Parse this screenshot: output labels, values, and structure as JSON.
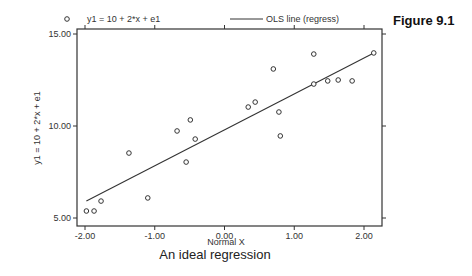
{
  "figure_label": "Figure 9.1",
  "caption": "An ideal regression",
  "legend": {
    "markers_label": "y1 = 10 + 2*x + e1",
    "line_label": "OLS line (regress)"
  },
  "colors": {
    "axis": "#333333",
    "points": "#333333",
    "line": "#333333",
    "background": "#ffffff"
  },
  "chart_data": {
    "type": "scatter",
    "title": "An ideal regression",
    "xlabel": "Normal X",
    "ylabel": "y1 = 10 + 2*x + e1",
    "xlim": [
      -2.1,
      2.3
    ],
    "ylim": [
      4.8,
      15.2
    ],
    "x_ticks": [
      -2.0,
      -1.0,
      0.0,
      1.0,
      2.0
    ],
    "x_tick_labels": [
      "-2.00",
      "-1.00",
      "0.00",
      "1.00",
      "2.00"
    ],
    "y_ticks": [
      5.0,
      10.0,
      15.0
    ],
    "y_tick_labels": [
      "5.00",
      "10.00",
      "15.00"
    ],
    "grid": false,
    "legend_position": "top",
    "series": [
      {
        "name": "y1 = 10 + 2*x + e1",
        "kind": "scatter",
        "marker": "hollow-circle",
        "points": [
          {
            "x": -1.98,
            "y": 5.38
          },
          {
            "x": -1.87,
            "y": 5.38
          },
          {
            "x": -1.77,
            "y": 5.92
          },
          {
            "x": -1.37,
            "y": 8.53
          },
          {
            "x": -1.1,
            "y": 6.09
          },
          {
            "x": -0.68,
            "y": 9.73
          },
          {
            "x": -0.55,
            "y": 8.04
          },
          {
            "x": -0.49,
            "y": 10.33
          },
          {
            "x": -0.42,
            "y": 9.29
          },
          {
            "x": 0.34,
            "y": 11.03
          },
          {
            "x": 0.44,
            "y": 11.3
          },
          {
            "x": 0.7,
            "y": 13.1
          },
          {
            "x": 0.78,
            "y": 10.76
          },
          {
            "x": 0.8,
            "y": 9.46
          },
          {
            "x": 1.28,
            "y": 13.91
          },
          {
            "x": 1.28,
            "y": 12.28
          },
          {
            "x": 1.48,
            "y": 12.45
          },
          {
            "x": 1.63,
            "y": 12.5
          },
          {
            "x": 1.83,
            "y": 12.45
          },
          {
            "x": 2.14,
            "y": 13.97
          }
        ]
      },
      {
        "name": "OLS line (regress)",
        "kind": "line",
        "points": [
          {
            "x": -1.98,
            "y": 5.92
          },
          {
            "x": 2.14,
            "y": 13.97
          }
        ]
      }
    ]
  }
}
